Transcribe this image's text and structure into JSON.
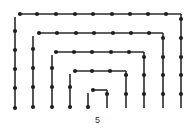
{
  "figure": {
    "caption": "5",
    "colors": {
      "stroke": "#2b2b2b",
      "dot": "#1f1f1f",
      "background": "#ffffff"
    },
    "dot_radius": 2.1,
    "rings": [
      {
        "name": "ring-1",
        "left_x": 15,
        "right_x": 181,
        "top_y": 14,
        "bottom_y": 109,
        "left_dots_y": [
          31,
          50,
          69,
          88,
          108
        ],
        "top_dots_x": [
          20,
          37,
          56,
          75,
          93,
          112,
          130,
          148,
          166
        ],
        "right_dots_y": [
          19,
          38,
          57,
          75,
          94
        ]
      },
      {
        "name": "ring-2",
        "left_x": 33,
        "right_x": 163,
        "top_y": 33,
        "bottom_y": 109,
        "left_dots_y": [
          49,
          68,
          87,
          107
        ],
        "top_dots_x": [
          39,
          57,
          76,
          94,
          113,
          131,
          149
        ],
        "right_dots_y": [
          38,
          57,
          75,
          94
        ]
      },
      {
        "name": "ring-3",
        "left_x": 52,
        "right_x": 144,
        "top_y": 52,
        "bottom_y": 109,
        "left_dots_y": [
          68,
          87,
          107
        ],
        "top_dots_x": [
          56,
          74,
          92,
          111,
          129
        ],
        "right_dots_y": [
          57,
          75,
          94
        ]
      },
      {
        "name": "ring-4",
        "left_x": 70,
        "right_x": 126,
        "top_y": 71,
        "bottom_y": 109,
        "left_dots_y": [
          87,
          107
        ],
        "top_dots_x": [
          75,
          92,
          110
        ],
        "right_dots_y": [
          75,
          94
        ]
      },
      {
        "name": "ring-5",
        "left_x": 88,
        "right_x": 107,
        "top_y": 90,
        "bottom_y": 109,
        "left_dots_y": [
          107
        ],
        "top_dots_x": [
          93
        ],
        "right_dots_y": [
          94
        ]
      }
    ]
  }
}
